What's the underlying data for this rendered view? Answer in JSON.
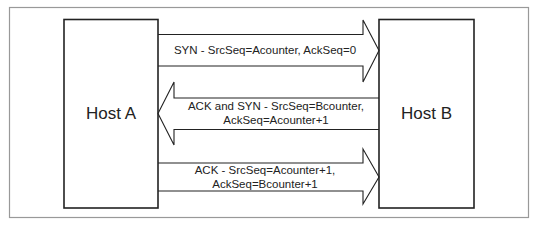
{
  "hosts": {
    "a": {
      "label": "Host A"
    },
    "b": {
      "label": "Host B"
    }
  },
  "messages": [
    {
      "direction": "A-to-B",
      "line1": "SYN -  SrcSeq=Acounter, AckSeq=0",
      "line2": ""
    },
    {
      "direction": "B-to-A",
      "line1": "ACK and SYN - SrcSeq=Bcounter,",
      "line2": "AckSeq=Acounter+1"
    },
    {
      "direction": "A-to-B",
      "line1": "ACK - SrcSeq=Acounter+1,",
      "line2": "AckSeq=Bcounter+1"
    }
  ],
  "colors": {
    "frame": "#999999",
    "stroke": "#222222",
    "text": "#222222",
    "background": "#ffffff"
  }
}
